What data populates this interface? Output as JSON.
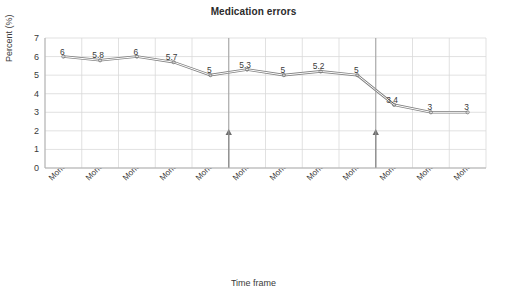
{
  "chart_data": {
    "type": "line",
    "title": "Medication errors",
    "xlabel": "Time frame",
    "ylabel": "Percent (%)",
    "ylim": [
      0,
      7
    ],
    "yticks": [
      0,
      1,
      2,
      3,
      4,
      5,
      6,
      7
    ],
    "grid": true,
    "legend": "none",
    "categories": [
      "Month 1",
      "Month 2",
      "Month 3",
      "Month 4",
      "Month 5/intervention",
      "Month 6",
      "Month 7",
      "Month 8",
      "Month 9/Revision to plan",
      "Month 10",
      "Month 11",
      "Month 12"
    ],
    "values": [
      6,
      5.8,
      6,
      5.7,
      5,
      5.3,
      5,
      5.2,
      5,
      3.4,
      3,
      3
    ],
    "point_labels": [
      "6",
      "5.8",
      "6",
      "5.7",
      "5",
      "5.3",
      "5",
      "5.2",
      "5",
      "3.4",
      "3",
      "3"
    ],
    "annotations": [
      {
        "name": "intervention-arrow",
        "category": "Month 5/intervention",
        "direction": "up"
      },
      {
        "name": "revision-arrow",
        "category": "Month 9/Revision to plan",
        "direction": "up"
      }
    ],
    "series_color": "#808080",
    "grid_color": "#d9d9d9",
    "text_color": "#3a3a3a"
  }
}
